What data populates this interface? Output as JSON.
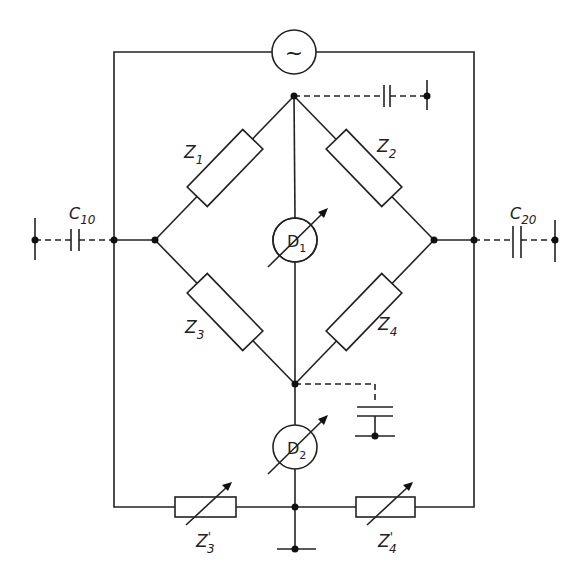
{
  "diagram": {
    "type": "circuit",
    "title": "",
    "source": {
      "symbol": "~",
      "name": "AC source"
    },
    "components": {
      "Z1": {
        "letter": "Z",
        "sub": "1",
        "prime": ""
      },
      "Z2": {
        "letter": "Z",
        "sub": "2",
        "prime": ""
      },
      "Z3": {
        "letter": "Z",
        "sub": "3",
        "prime": ""
      },
      "Z4": {
        "letter": "Z",
        "sub": "4",
        "prime": ""
      },
      "Z3p": {
        "letter": "Z",
        "sub": "3",
        "prime": "'"
      },
      "Z4p": {
        "letter": "Z",
        "sub": "4",
        "prime": "'"
      },
      "C10": {
        "letter": "C",
        "sub": "10"
      },
      "C20": {
        "letter": "C",
        "sub": "20"
      },
      "D1": {
        "letter": "D",
        "sub": "1"
      },
      "D2": {
        "letter": "D",
        "sub": "2"
      }
    }
  }
}
